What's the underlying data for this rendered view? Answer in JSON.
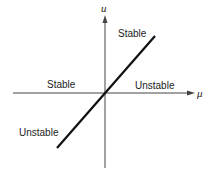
{
  "diagram": {
    "type": "bifurcation-diagram",
    "axes": {
      "vertical_label": "u",
      "horizontal_label": "μ"
    },
    "labels": {
      "upper_right": "Stable",
      "left_axis": "Stable",
      "right_axis": "Unstable",
      "lower_left": "Unstable"
    },
    "colors": {
      "axis": "#444444",
      "branch": "#111111",
      "text": "#222222"
    }
  }
}
